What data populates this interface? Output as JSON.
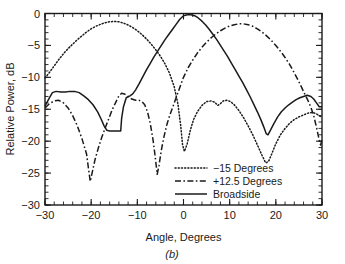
{
  "chart_data": {
    "type": "line",
    "title": "",
    "subcaption": "(b)",
    "xlabel": "Angle, Degrees",
    "ylabel": "Relative Power, dB",
    "xlim": [
      -30,
      30
    ],
    "ylim": [
      -30,
      0
    ],
    "xticks": [
      -30,
      -20,
      -10,
      0,
      10,
      20,
      30
    ],
    "xtick_labels": [
      "−30",
      "−20",
      "−10",
      "0",
      "10",
      "20",
      "30"
    ],
    "yticks": [
      0,
      -5,
      -10,
      -15,
      -20,
      -25,
      -30
    ],
    "ytick_labels": [
      "0",
      "−5",
      "−10",
      "−15",
      "−20",
      "−25",
      "−30"
    ],
    "x_minor_step": 2,
    "y_minor_step": 1,
    "grid": false,
    "legend_position": "lower-center-right",
    "series": [
      {
        "name": "−15 Degrees",
        "style": "dotted",
        "points": [
          [
            -30,
            -10.1
          ],
          [
            -29,
            -9.2
          ],
          [
            -28,
            -8.2
          ],
          [
            -27,
            -7.2
          ],
          [
            -26,
            -6.3
          ],
          [
            -25,
            -5.5
          ],
          [
            -24,
            -4.8
          ],
          [
            -23,
            -4.1
          ],
          [
            -22,
            -3.5
          ],
          [
            -21,
            -2.9
          ],
          [
            -20,
            -2.4
          ],
          [
            -19,
            -2.0
          ],
          [
            -18,
            -1.7
          ],
          [
            -17,
            -1.45
          ],
          [
            -16,
            -1.3
          ],
          [
            -15,
            -1.25
          ],
          [
            -14,
            -1.3
          ],
          [
            -13,
            -1.5
          ],
          [
            -12,
            -1.8
          ],
          [
            -11,
            -2.2
          ],
          [
            -10,
            -2.7
          ],
          [
            -9,
            -3.3
          ],
          [
            -8,
            -4.0
          ],
          [
            -7,
            -4.8
          ],
          [
            -6,
            -5.7
          ],
          [
            -5,
            -6.7
          ],
          [
            -4,
            -7.9
          ],
          [
            -3,
            -9.4
          ],
          [
            -2,
            -11.5
          ],
          [
            -1.2,
            -14.2
          ],
          [
            -0.6,
            -17.6
          ],
          [
            -0.2,
            -20.6
          ],
          [
            0.2,
            -21.6
          ],
          [
            0.8,
            -20.4
          ],
          [
            1.5,
            -18.2
          ],
          [
            2.2,
            -16.6
          ],
          [
            3,
            -15.4
          ],
          [
            4,
            -14.4
          ],
          [
            5,
            -13.8
          ],
          [
            6,
            -13.7
          ],
          [
            6.8,
            -13.9
          ],
          [
            7.4,
            -14.4
          ],
          [
            7.9,
            -14.2
          ],
          [
            8.6,
            -13.7
          ],
          [
            9.4,
            -13.6
          ],
          [
            10.2,
            -13.8
          ],
          [
            11,
            -14.3
          ],
          [
            12,
            -15.2
          ],
          [
            13,
            -16.3
          ],
          [
            14,
            -17.6
          ],
          [
            15,
            -19.0
          ],
          [
            16,
            -20.6
          ],
          [
            17,
            -22.2
          ],
          [
            17.8,
            -23.4
          ],
          [
            18.4,
            -23.2
          ],
          [
            19,
            -22.2
          ],
          [
            20,
            -20.4
          ],
          [
            21,
            -19.0
          ],
          [
            22,
            -18.0
          ],
          [
            23,
            -17.2
          ],
          [
            24,
            -16.6
          ],
          [
            25,
            -16.2
          ],
          [
            26,
            -15.9
          ],
          [
            27,
            -15.6
          ],
          [
            28,
            -15.5
          ],
          [
            29,
            -15.8
          ],
          [
            30,
            -16.3
          ]
        ]
      },
      {
        "name": "+12.5 Degrees",
        "style": "dash-dot",
        "points": [
          [
            -30,
            -14.8
          ],
          [
            -29,
            -14.1
          ],
          [
            -28,
            -13.7
          ],
          [
            -27,
            -13.6
          ],
          [
            -26,
            -14.0
          ],
          [
            -25,
            -14.8
          ],
          [
            -24,
            -16.0
          ],
          [
            -23,
            -17.6
          ],
          [
            -22,
            -19.6
          ],
          [
            -21,
            -22.0
          ],
          [
            -20.6,
            -24.2
          ],
          [
            -20.2,
            -26.3
          ],
          [
            -19.8,
            -25.0
          ],
          [
            -19.2,
            -23.0
          ],
          [
            -18.5,
            -21.2
          ],
          [
            -17.8,
            -19.6
          ],
          [
            -17,
            -18.0
          ],
          [
            -16.2,
            -16.5
          ],
          [
            -15.4,
            -15.0
          ],
          [
            -14.6,
            -13.8
          ],
          [
            -14,
            -12.9
          ],
          [
            -13.4,
            -12.5
          ],
          [
            -12.8,
            -12.6
          ],
          [
            -12,
            -13.0
          ],
          [
            -11.2,
            -13.4
          ],
          [
            -10.4,
            -13.6
          ],
          [
            -9.6,
            -13.6
          ],
          [
            -9,
            -13.8
          ],
          [
            -8.4,
            -14.3
          ],
          [
            -7.8,
            -15.4
          ],
          [
            -7.2,
            -17.2
          ],
          [
            -6.6,
            -19.8
          ],
          [
            -6.1,
            -22.6
          ],
          [
            -5.7,
            -25.2
          ],
          [
            -5.3,
            -23.8
          ],
          [
            -4.8,
            -21.4
          ],
          [
            -4.2,
            -19.2
          ],
          [
            -3.6,
            -17.4
          ],
          [
            -3,
            -16.0
          ],
          [
            -2.4,
            -14.8
          ],
          [
            -1.8,
            -13.6
          ],
          [
            -1.2,
            -12.4
          ],
          [
            -0.6,
            -11.2
          ],
          [
            0,
            -10.0
          ],
          [
            1,
            -8.5
          ],
          [
            2,
            -7.3
          ],
          [
            3,
            -6.2
          ],
          [
            4,
            -5.3
          ],
          [
            5,
            -4.5
          ],
          [
            6,
            -3.8
          ],
          [
            7,
            -3.2
          ],
          [
            8,
            -2.7
          ],
          [
            9,
            -2.3
          ],
          [
            10,
            -1.95
          ],
          [
            11,
            -1.75
          ],
          [
            12,
            -1.62
          ],
          [
            12.5,
            -1.6
          ],
          [
            13,
            -1.62
          ],
          [
            14,
            -1.75
          ],
          [
            15,
            -2.0
          ],
          [
            16,
            -2.4
          ],
          [
            17,
            -2.9
          ],
          [
            18,
            -3.5
          ],
          [
            19,
            -4.2
          ],
          [
            20,
            -5.0
          ],
          [
            21,
            -5.9
          ],
          [
            22,
            -6.9
          ],
          [
            23,
            -8.0
          ],
          [
            24,
            -9.3
          ],
          [
            25,
            -10.7
          ],
          [
            26,
            -12.2
          ],
          [
            27,
            -13.7
          ],
          [
            27.6,
            -14.7
          ],
          [
            28.2,
            -16.0
          ],
          [
            28.8,
            -17.8
          ],
          [
            29.3,
            -19.5
          ],
          [
            29.7,
            -20.6
          ],
          [
            30,
            -19.8
          ]
        ]
      },
      {
        "name": "Broadside",
        "style": "solid",
        "points": [
          [
            -30,
            -14.5
          ],
          [
            -29.2,
            -13.4
          ],
          [
            -28.4,
            -12.4
          ],
          [
            -27.6,
            -12.2
          ],
          [
            -26.6,
            -12.3
          ],
          [
            -25.6,
            -12.3
          ],
          [
            -24.6,
            -12.2
          ],
          [
            -23.6,
            -12.2
          ],
          [
            -22.6,
            -12.4
          ],
          [
            -21.6,
            -12.9
          ],
          [
            -20.6,
            -13.5
          ],
          [
            -19.6,
            -14.3
          ],
          [
            -18.6,
            -15.4
          ],
          [
            -17.8,
            -16.6
          ],
          [
            -17.2,
            -17.6
          ],
          [
            -16.6,
            -18.3
          ],
          [
            -16,
            -18.4
          ],
          [
            -15,
            -18.4
          ],
          [
            -14,
            -18.4
          ],
          [
            -13.6,
            -18.4
          ],
          [
            -13.4,
            -16.4
          ],
          [
            -13,
            -14.6
          ],
          [
            -12.4,
            -13.2
          ],
          [
            -11.6,
            -12.9
          ],
          [
            -11,
            -12.6
          ],
          [
            -10.4,
            -12.0
          ],
          [
            -9.6,
            -11.0
          ],
          [
            -8.8,
            -9.9
          ],
          [
            -8,
            -8.8
          ],
          [
            -7.2,
            -7.8
          ],
          [
            -6.4,
            -6.8
          ],
          [
            -5.6,
            -5.9
          ],
          [
            -4.8,
            -5.0
          ],
          [
            -4,
            -4.1
          ],
          [
            -3.2,
            -3.3
          ],
          [
            -2.4,
            -2.5
          ],
          [
            -1.6,
            -1.7
          ],
          [
            -0.8,
            -0.9
          ],
          [
            0,
            -0.35
          ],
          [
            0.8,
            -0.2
          ],
          [
            1.6,
            -0.2
          ],
          [
            2.4,
            -0.35
          ],
          [
            3.2,
            -0.7
          ],
          [
            4,
            -1.2
          ],
          [
            4.8,
            -1.8
          ],
          [
            5.6,
            -2.5
          ],
          [
            6.4,
            -3.3
          ],
          [
            7.2,
            -4.1
          ],
          [
            8,
            -5.0
          ],
          [
            8.8,
            -5.9
          ],
          [
            9.6,
            -6.8
          ],
          [
            10.4,
            -7.8
          ],
          [
            11.2,
            -8.8
          ],
          [
            12,
            -9.8
          ],
          [
            12.8,
            -10.8
          ],
          [
            13.6,
            -11.9
          ],
          [
            14.4,
            -13.0
          ],
          [
            15.2,
            -14.2
          ],
          [
            16,
            -15.4
          ],
          [
            16.8,
            -16.7
          ],
          [
            17.4,
            -17.8
          ],
          [
            17.9,
            -18.8
          ],
          [
            18.3,
            -19.0
          ],
          [
            18.9,
            -18.2
          ],
          [
            19.6,
            -17.2
          ],
          [
            20.4,
            -16.2
          ],
          [
            21.2,
            -15.4
          ],
          [
            22,
            -14.8
          ],
          [
            22.8,
            -14.3
          ],
          [
            23.6,
            -13.9
          ],
          [
            24.4,
            -13.5
          ],
          [
            25.2,
            -13.2
          ],
          [
            26,
            -13.0
          ],
          [
            26.8,
            -12.8
          ],
          [
            27.6,
            -13.0
          ],
          [
            28.2,
            -13.4
          ],
          [
            28.8,
            -14.0
          ],
          [
            29.4,
            -14.6
          ],
          [
            30,
            -14.6
          ]
        ]
      }
    ]
  }
}
